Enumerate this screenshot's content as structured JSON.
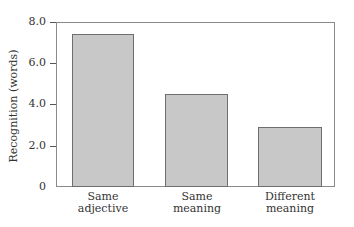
{
  "chart_data": {
    "type": "bar",
    "title": "",
    "xlabel": "",
    "ylabel": "Recognition (words)",
    "categories": [
      "Same adjective",
      "Same meaning",
      "Different meaning"
    ],
    "category_lines": [
      [
        "Same",
        "adjective"
      ],
      [
        "Same",
        "meaning"
      ],
      [
        "Different",
        "meaning"
      ]
    ],
    "values": [
      7.4,
      4.5,
      2.9
    ],
    "ylim": [
      0,
      8
    ],
    "yticks": [
      "0",
      "2.0",
      "4.0",
      "6.0",
      "8.0"
    ],
    "grid": false,
    "legend": null,
    "bar_color": "#c8c8c8",
    "bar_edge_color": "#6e6e6e"
  }
}
